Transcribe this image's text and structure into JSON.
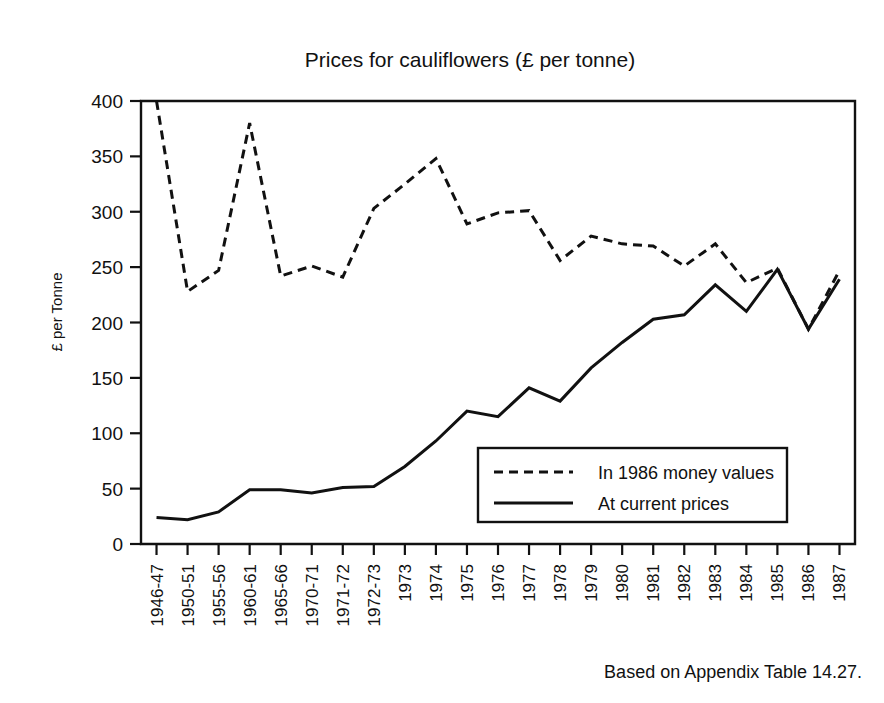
{
  "chart_data": {
    "type": "line",
    "title": "Prices for cauliflowers (£ per tonne)",
    "xlabel": "",
    "ylabel": "£ per Tonne",
    "ylim": [
      0,
      400
    ],
    "yticks": [
      0,
      50,
      100,
      150,
      200,
      250,
      300,
      350,
      400
    ],
    "grid": false,
    "legend_position": "inside-lower-right",
    "source_note": "Based on Appendix Table 14.27.",
    "categories": [
      "1946-47",
      "1950-51",
      "1955-56",
      "1960-61",
      "1965-66",
      "1970-71",
      "1971-72",
      "1972-73",
      "1973",
      "1974",
      "1975",
      "1976",
      "1977",
      "1978",
      "1979",
      "1980",
      "1981",
      "1982",
      "1983",
      "1984",
      "1985",
      "1986",
      "1987"
    ],
    "series": [
      {
        "name": "In 1986 money values",
        "style": "dashed",
        "color": "#111111",
        "values": [
          400,
          228,
          247,
          380,
          242,
          251,
          241,
          303,
          325,
          348,
          289,
          299,
          301,
          256,
          278,
          271,
          269,
          251,
          271,
          236,
          249,
          194,
          247
        ]
      },
      {
        "name": "At current prices",
        "style": "solid",
        "color": "#111111",
        "values": [
          24,
          22,
          29,
          49,
          49,
          46,
          51,
          52,
          70,
          93,
          120,
          115,
          141,
          129,
          159,
          182,
          203,
          207,
          234,
          210,
          248,
          194,
          239
        ]
      }
    ]
  },
  "legend": {
    "entries": [
      {
        "label": "In 1986 money values",
        "style": "dashed"
      },
      {
        "label": "At current prices",
        "style": "solid"
      }
    ]
  },
  "axes": {
    "y_title": "£ per Tonne",
    "y_tick_labels": [
      "0",
      "50",
      "100",
      "150",
      "200",
      "250",
      "300",
      "350",
      "400"
    ],
    "x_tick_labels": [
      "1946-47",
      "1950-51",
      "1955-56",
      "1960-61",
      "1965-66",
      "1970-71",
      "1971-72",
      "1972-73",
      "1973",
      "1974",
      "1975",
      "1976",
      "1977",
      "1978",
      "1979",
      "1980",
      "1981",
      "1982",
      "1983",
      "1984",
      "1985",
      "1986",
      "1987"
    ]
  },
  "header": {
    "title": "Prices for cauliflowers (£ per tonne)"
  },
  "footer": {
    "note": "Based on Appendix Table 14.27."
  }
}
